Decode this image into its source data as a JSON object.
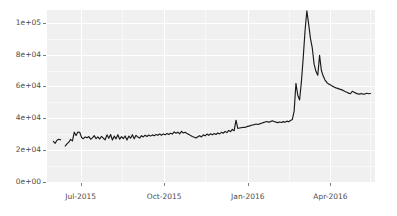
{
  "chart_data": {
    "type": "line",
    "title": "",
    "subtitle": "",
    "xlabel": "",
    "ylabel": "",
    "legend": [],
    "legend_position": "none",
    "grid": true,
    "theme": "ggplot2-grey",
    "line_color": "#1a1a1a",
    "panel_background": "#f0f0f0",
    "gridline_color": "#ffffff",
    "axis_text_color": "#4d4d4d",
    "ylim": [
      0,
      108000
    ],
    "y_ticks": [
      0,
      20000,
      40000,
      60000,
      80000,
      100000
    ],
    "y_tick_labels": [
      "0e+00",
      "2e+04",
      "4e+04",
      "6e+04",
      "8e+04",
      "1e+05"
    ],
    "y_minor_ticks": [
      10000,
      30000,
      50000,
      70000,
      90000
    ],
    "x_ticks": [
      "2015-07-01",
      "2015-10-01",
      "2016-01-01",
      "2016-04-01"
    ],
    "x_tick_labels": [
      "Jul-2015",
      "Oct-2015",
      "Jan-2016",
      "Apr-2016"
    ],
    "x_minor_ticks": [
      "2015-08-15",
      "2015-11-15",
      "2016-02-15",
      "2016-05-15"
    ],
    "xlim": [
      "2015-05-25",
      "2016-05-20"
    ],
    "series": [
      {
        "name": "value",
        "color": "#1a1a1a",
        "x": [
          "2015-06-01",
          "2015-06-03",
          "2015-06-05",
          "2015-06-07",
          "2015-06-09",
          "2015-06-11",
          "2015-06-14",
          "2015-06-16",
          "2015-06-18",
          "2015-06-20",
          "2015-06-22",
          "2015-06-24",
          "2015-06-26",
          "2015-06-28",
          "2015-06-30",
          "2015-07-02",
          "2015-07-04",
          "2015-07-06",
          "2015-07-08",
          "2015-07-10",
          "2015-07-12",
          "2015-07-14",
          "2015-07-16",
          "2015-07-18",
          "2015-07-20",
          "2015-07-22",
          "2015-07-24",
          "2015-07-26",
          "2015-07-28",
          "2015-07-30",
          "2015-08-01",
          "2015-08-03",
          "2015-08-05",
          "2015-08-07",
          "2015-08-09",
          "2015-08-11",
          "2015-08-13",
          "2015-08-15",
          "2015-08-17",
          "2015-08-19",
          "2015-08-21",
          "2015-08-23",
          "2015-08-25",
          "2015-08-27",
          "2015-08-29",
          "2015-08-31",
          "2015-09-02",
          "2015-09-04",
          "2015-09-06",
          "2015-09-08",
          "2015-09-10",
          "2015-09-12",
          "2015-09-14",
          "2015-09-16",
          "2015-09-18",
          "2015-09-20",
          "2015-09-22",
          "2015-09-24",
          "2015-09-26",
          "2015-09-28",
          "2015-09-30",
          "2015-10-02",
          "2015-10-04",
          "2015-10-06",
          "2015-10-08",
          "2015-10-10",
          "2015-10-12",
          "2015-10-14",
          "2015-10-16",
          "2015-10-18",
          "2015-10-20",
          "2015-10-22",
          "2015-10-24",
          "2015-10-26",
          "2015-10-28",
          "2015-10-30",
          "2015-11-01",
          "2015-11-03",
          "2015-11-05",
          "2015-11-07",
          "2015-11-09",
          "2015-11-11",
          "2015-11-13",
          "2015-11-15",
          "2015-11-17",
          "2015-11-19",
          "2015-11-21",
          "2015-11-23",
          "2015-11-25",
          "2015-11-27",
          "2015-11-29",
          "2015-12-01",
          "2015-12-03",
          "2015-12-05",
          "2015-12-07",
          "2015-12-09",
          "2015-12-11",
          "2015-12-13",
          "2015-12-15",
          "2015-12-17",
          "2015-12-19",
          "2015-12-21",
          "2015-12-23",
          "2015-12-25",
          "2015-12-27",
          "2015-12-29",
          "2015-12-31",
          "2016-01-02",
          "2016-01-04",
          "2016-01-06",
          "2016-01-08",
          "2016-01-10",
          "2016-01-12",
          "2016-01-14",
          "2016-01-16",
          "2016-01-18",
          "2016-01-20",
          "2016-01-22",
          "2016-01-24",
          "2016-01-26",
          "2016-01-28",
          "2016-01-30",
          "2016-02-01",
          "2016-02-03",
          "2016-02-05",
          "2016-02-07",
          "2016-02-09",
          "2016-02-11",
          "2016-02-13",
          "2016-02-15",
          "2016-02-17",
          "2016-02-19",
          "2016-02-21",
          "2016-02-23",
          "2016-02-25",
          "2016-02-27",
          "2016-02-29",
          "2016-03-02",
          "2016-03-04",
          "2016-03-06",
          "2016-03-08",
          "2016-03-10",
          "2016-03-12",
          "2016-03-14",
          "2016-03-16",
          "2016-03-18",
          "2016-03-20",
          "2016-03-22",
          "2016-03-24",
          "2016-03-26",
          "2016-03-28",
          "2016-03-30",
          "2016-04-01",
          "2016-04-03",
          "2016-04-05",
          "2016-04-07",
          "2016-04-09",
          "2016-04-11",
          "2016-04-13",
          "2016-04-15",
          "2016-04-17",
          "2016-04-19",
          "2016-04-21",
          "2016-04-23",
          "2016-04-25",
          "2016-04-27",
          "2016-04-29",
          "2016-05-01",
          "2016-05-03",
          "2016-05-05",
          "2016-05-07",
          "2016-05-09",
          "2016-05-11",
          "2016-05-13",
          "2016-05-15"
        ],
        "values": [
          25500,
          24300,
          26200,
          26800,
          26500,
          null,
          22600,
          23900,
          25000,
          26800,
          25800,
          31300,
          29200,
          31400,
          31200,
          28000,
          27200,
          28300,
          27800,
          28500,
          26900,
          27700,
          29100,
          27200,
          28300,
          27000,
          28600,
          27500,
          26500,
          29600,
          27400,
          29800,
          26400,
          28800,
          27100,
          29700,
          26900,
          28500,
          27200,
          28900,
          26400,
          28800,
          27500,
          29700,
          27100,
          29300,
          28200,
          27600,
          29100,
          28300,
          29400,
          28600,
          29500,
          28800,
          29600,
          29100,
          29800,
          29300,
          30100,
          29400,
          30200,
          29600,
          30400,
          29800,
          30600,
          30100,
          31500,
          30600,
          31300,
          30200,
          31800,
          30800,
          31200,
          30400,
          29900,
          29200,
          28600,
          28100,
          27600,
          28400,
          29100,
          28300,
          29600,
          29000,
          30100,
          29300,
          30300,
          29600,
          30400,
          29800,
          30800,
          30200,
          31200,
          30600,
          31800,
          31000,
          32400,
          31600,
          33000,
          32200,
          38800,
          33600,
          33900,
          34100,
          34400,
          34200,
          34800,
          35100,
          35400,
          35800,
          36000,
          36400,
          36100,
          36500,
          36900,
          37300,
          37700,
          38000,
          37600,
          37900,
          38400,
          38000,
          37600,
          37300,
          37700,
          37400,
          37900,
          37500,
          38200,
          37800,
          38600,
          39200,
          44500,
          62000,
          54500,
          51500,
          63000,
          78000,
          95000,
          107500,
          99000,
          90000,
          84000,
          74000,
          69500,
          67000,
          79500,
          70000,
          66500,
          64000,
          62500,
          61500,
          61000,
          60200,
          59600,
          59100,
          58800,
          58300,
          58000,
          57400,
          56800,
          56300,
          55800,
          55400,
          57000,
          56400,
          55800,
          55300,
          55200,
          55600,
          55100,
          55300,
          55700,
          55400,
          55600
        ]
      }
    ]
  }
}
